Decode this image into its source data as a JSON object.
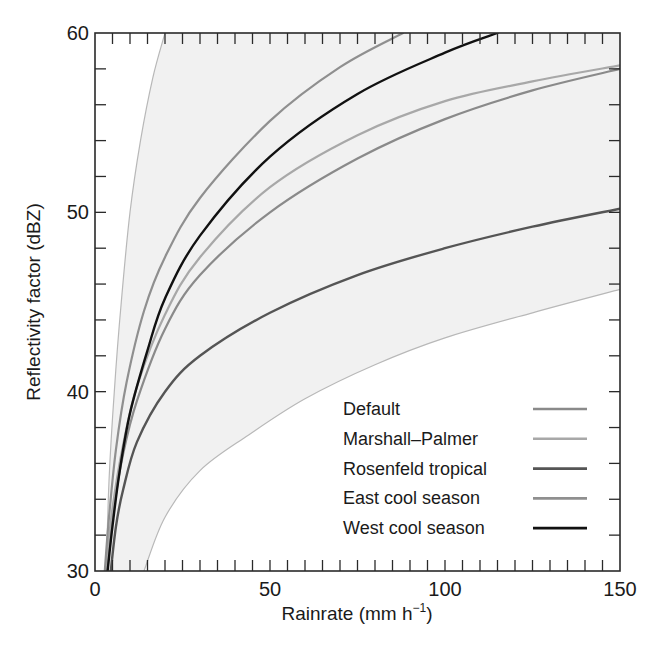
{
  "chart_data": {
    "type": "line",
    "title": "",
    "xlabel": "Rainrate (mm h",
    "xlabel_sup": "−1",
    "xlabel_close": ")",
    "ylabel": "Reflectivity factor (dBZ)",
    "xlim": [
      0,
      150
    ],
    "ylim": [
      30,
      60
    ],
    "x_ticks_major": [
      0,
      50,
      100,
      150
    ],
    "x_tick_labels": [
      "0",
      "50",
      "100",
      "150"
    ],
    "x_minor_step": 5,
    "y_ticks_major": [
      30,
      40,
      50,
      60
    ],
    "y_tick_labels": [
      "30",
      "40",
      "50",
      "60"
    ],
    "y_minor_step": 2,
    "grid": false,
    "legend_position": "lower right",
    "envelope": {
      "fill": "#f1f1f1",
      "edge": "#b8b8b8",
      "upper": [
        [
          3.2,
          30
        ],
        [
          4,
          35
        ],
        [
          5.5,
          40
        ],
        [
          7.5,
          45
        ],
        [
          10,
          50
        ],
        [
          13,
          54
        ],
        [
          16.5,
          57.5
        ],
        [
          20,
          60
        ]
      ],
      "lower": [
        [
          14,
          30
        ],
        [
          20,
          33
        ],
        [
          30,
          35.6
        ],
        [
          44,
          37.6
        ],
        [
          60,
          39.6
        ],
        [
          80,
          41.5
        ],
        [
          100,
          43.0
        ],
        [
          125,
          44.4
        ],
        [
          150,
          45.7
        ]
      ]
    },
    "series": [
      {
        "name": "Default",
        "color": "#8a8a8a",
        "width": 2.2,
        "points": [
          [
            3.3,
            30
          ],
          [
            5,
            33
          ],
          [
            8,
            36.5
          ],
          [
            12,
            39.5
          ],
          [
            20,
            43.5
          ],
          [
            30,
            46.5
          ],
          [
            50,
            50.0
          ],
          [
            75,
            53.0
          ],
          [
            100,
            55.2
          ],
          [
            125,
            56.8
          ],
          [
            150,
            58.0
          ]
        ]
      },
      {
        "name": "Marshall–Palmer",
        "color": "#a8a8a8",
        "width": 2.2,
        "points": [
          [
            3.0,
            30
          ],
          [
            5,
            33.5
          ],
          [
            8,
            37
          ],
          [
            12,
            40.3
          ],
          [
            20,
            44.3
          ],
          [
            30,
            47.5
          ],
          [
            50,
            51.4
          ],
          [
            75,
            54.3
          ],
          [
            100,
            56.2
          ],
          [
            125,
            57.3
          ],
          [
            150,
            58.2
          ]
        ]
      },
      {
        "name": "Rosenfeld tropical",
        "color": "#555555",
        "width": 2.4,
        "points": [
          [
            4.5,
            30
          ],
          [
            6,
            32.5
          ],
          [
            8,
            34.5
          ],
          [
            12,
            37.2
          ],
          [
            20,
            40.0
          ],
          [
            30,
            42.0
          ],
          [
            50,
            44.4
          ],
          [
            75,
            46.5
          ],
          [
            100,
            48.0
          ],
          [
            125,
            49.2
          ],
          [
            150,
            50.2
          ]
        ]
      },
      {
        "name": "East cool season",
        "color": "#8f8f8f",
        "width": 2.2,
        "points": [
          [
            2.8,
            30
          ],
          [
            4,
            33
          ],
          [
            6,
            36.8
          ],
          [
            9,
            40.5
          ],
          [
            14,
            44.5
          ],
          [
            20,
            47.5
          ],
          [
            30,
            50.8
          ],
          [
            50,
            55.1
          ],
          [
            70,
            58.1
          ],
          [
            88,
            60
          ]
        ]
      },
      {
        "name": "West cool season",
        "color": "#111111",
        "width": 2.4,
        "points": [
          [
            3.6,
            30
          ],
          [
            5,
            32.5
          ],
          [
            7,
            35.5
          ],
          [
            10,
            38.8
          ],
          [
            15,
            42.3
          ],
          [
            20,
            45.2
          ],
          [
            30,
            48.7
          ],
          [
            50,
            53.1
          ],
          [
            75,
            56.6
          ],
          [
            100,
            58.9
          ],
          [
            115,
            60
          ]
        ]
      }
    ]
  }
}
